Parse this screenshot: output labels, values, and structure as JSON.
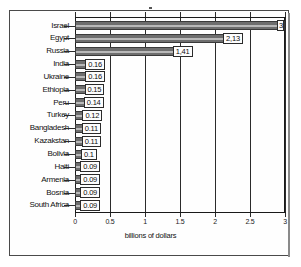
{
  "chart_data": {
    "type": "bar",
    "orientation": "horizontal",
    "title": "",
    "xlabel": "billions of dollars",
    "ylabel": "",
    "xlim": [
      0,
      3
    ],
    "xticks": [
      "0",
      "0.5",
      "1",
      "1.5",
      "2",
      "2.5",
      "3"
    ],
    "xtick_values": [
      0,
      0.5,
      1,
      1.5,
      2,
      2.5,
      3
    ],
    "grid": true,
    "legend": false,
    "categories": [
      "Israel",
      "Egypt",
      "Russia",
      "India",
      "Ukraine",
      "Ethiopia",
      "Peru",
      "Turkey",
      "Bangladesh",
      "Kazakstan",
      "Bolivia",
      "Haiti",
      "Armenia",
      "Bosnia",
      "South Africa"
    ],
    "values": [
      3.0,
      2.13,
      1.41,
      0.16,
      0.16,
      0.15,
      0.14,
      0.12,
      0.11,
      0.11,
      0.1,
      0.09,
      0.09,
      0.09,
      0.09
    ],
    "data_labels": [
      "3",
      "2,13",
      "1,41",
      "0.16",
      "0.16",
      "0.15",
      "0.14",
      "0.12",
      "0.11",
      "0.11",
      "0.1",
      "0.09",
      "0.09",
      "0.09",
      "0.09"
    ],
    "bar_color": "#6e6e6e",
    "bar_edge_color": "#3a3a3a",
    "gridline_color": "#2b2b2b",
    "label_box_fill": "#fdfdfd"
  }
}
